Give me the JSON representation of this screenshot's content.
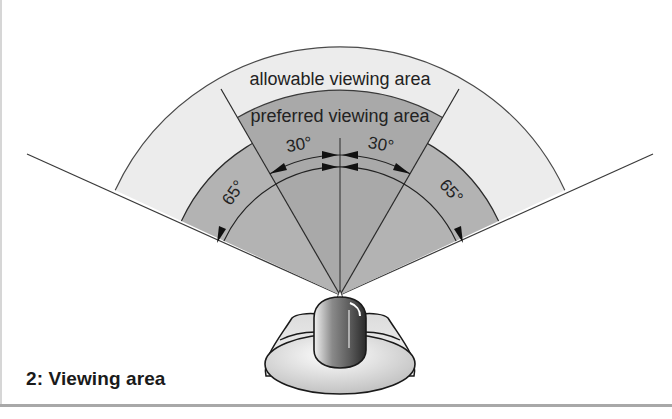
{
  "figure": {
    "caption": "2:  Viewing area",
    "labels": {
      "allowable": "allowable viewing area",
      "preferred": "preferred viewing area",
      "angle_preferred_left": "30°",
      "angle_preferred_right": "30°",
      "angle_allowable_left": "65°",
      "angle_allowable_right": "65°"
    },
    "colors": {
      "allowable_fill": "#ececec",
      "preferred_fill": "#a9a9a9",
      "inner_sector_fill": "#b3b3b3",
      "line": "#3a3a3a",
      "background": "#ffffff"
    },
    "angles": {
      "preferred_half_angle_deg": 30,
      "allowable_half_angle_deg": 65
    }
  }
}
